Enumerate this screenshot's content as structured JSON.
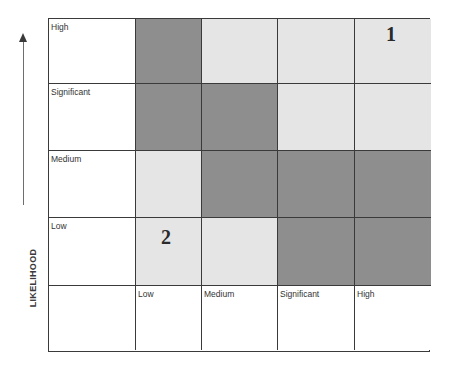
{
  "axis": {
    "y_label": "LIKELIHOOD",
    "arrow_direction": "up"
  },
  "colors": {
    "high_risk": "#8e8e8e",
    "low_risk": "#e5e5e5",
    "header": "#ffffff",
    "border": "#3a3a3a"
  },
  "rows": [
    {
      "label": "High",
      "cells": [
        "dark",
        "light",
        "light",
        "light"
      ],
      "markers": [
        "",
        "",
        "",
        "1"
      ]
    },
    {
      "label": "Significant",
      "cells": [
        "dark",
        "dark",
        "light",
        "light"
      ],
      "markers": [
        "",
        "",
        "",
        ""
      ]
    },
    {
      "label": "Medium",
      "cells": [
        "light",
        "dark",
        "dark",
        "dark"
      ],
      "markers": [
        "",
        "",
        "",
        ""
      ]
    },
    {
      "label": "Low",
      "cells": [
        "light",
        "light",
        "dark",
        "dark"
      ],
      "markers": [
        "2",
        "",
        "",
        ""
      ]
    }
  ],
  "columns": [
    {
      "label": "Low"
    },
    {
      "label": "Medium"
    },
    {
      "label": "Significant"
    },
    {
      "label": "High"
    }
  ],
  "markers": [
    {
      "id": "1",
      "row": "High",
      "column": "High"
    },
    {
      "id": "2",
      "row": "Low",
      "column": "Low"
    }
  ]
}
